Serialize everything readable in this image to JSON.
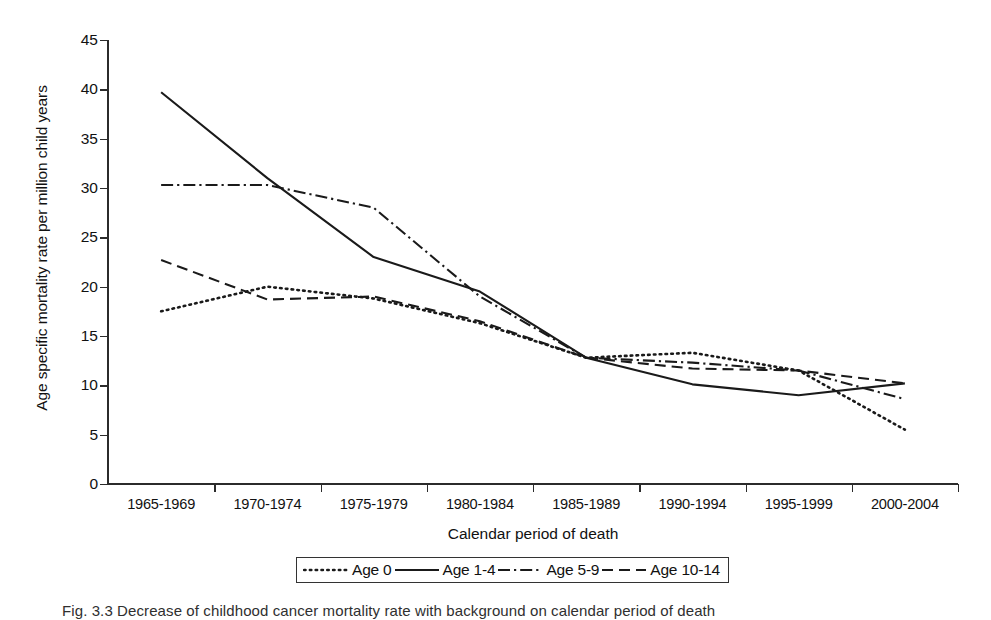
{
  "chart_data": {
    "type": "line",
    "title": "",
    "xlabel": "Calendar period of death",
    "ylabel": "Age specific mortality rate per million child years",
    "categories": [
      "1965-1969",
      "1970-1974",
      "1975-1979",
      "1980-1984",
      "1985-1989",
      "1990-1994",
      "1995-1999",
      "2000-2004"
    ],
    "ylim": [
      0,
      45
    ],
    "yticks": [
      0,
      5,
      10,
      15,
      20,
      25,
      30,
      35,
      40,
      45
    ],
    "grid": false,
    "legend_position": "bottom",
    "series": [
      {
        "name": "Age 0",
        "style": "dotted",
        "dasharray": "1.6,4.2",
        "values": [
          17.5,
          20.0,
          18.8,
          16.3,
          12.8,
          13.3,
          11.5,
          5.5
        ]
      },
      {
        "name": "Age 1-4",
        "style": "solid",
        "dasharray": "",
        "values": [
          39.7,
          31.0,
          23.0,
          19.5,
          12.8,
          10.1,
          9.0,
          10.2
        ]
      },
      {
        "name": "Age 5-9",
        "style": "dash-dot",
        "dasharray": "12,4,2.2,4",
        "values": [
          30.3,
          30.3,
          28.0,
          19.0,
          12.8,
          12.3,
          11.5,
          8.6
        ]
      },
      {
        "name": "Age 10-14",
        "style": "dashed",
        "dasharray": "11,6",
        "values": [
          22.7,
          18.7,
          19.0,
          16.5,
          12.8,
          11.7,
          11.5,
          10.2
        ]
      }
    ]
  },
  "axes": {
    "y_title": "Age specific mortality rate per million child years",
    "x_title": "Calendar period of death",
    "y_tick_labels": [
      "45",
      "40",
      "35",
      "30",
      "25",
      "20",
      "15",
      "10",
      "5",
      "0"
    ],
    "x_tick_labels": [
      "1965-1969",
      "1970-1974",
      "1975-1979",
      "1980-1984",
      "1985-1989",
      "1990-1994",
      "1995-1999",
      "2000-2004"
    ]
  },
  "legend": {
    "entries": [
      {
        "label": "Age 0"
      },
      {
        "label": "Age 1-4"
      },
      {
        "label": "Age 5-9"
      },
      {
        "label": "Age 10-14"
      }
    ]
  },
  "caption": {
    "text": "Fig. 3.3 Decrease of childhood cancer mortality rate with background on calendar period of death"
  },
  "colors": {
    "line": "#1a1a1a",
    "axis": "#2b2b2b",
    "text": "#111111",
    "background": "#ffffff"
  }
}
